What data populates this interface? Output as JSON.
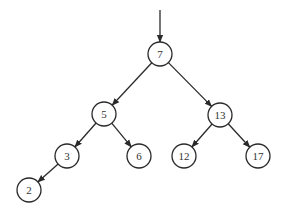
{
  "diagram": {
    "type": "binary-search-tree",
    "node_radius": 12,
    "colors": {
      "stroke": "#2a2a2a",
      "fill": "#ffffff",
      "text": "#333333",
      "background": "#ffffff"
    },
    "root_pointer": {
      "x1": 160,
      "y1": 10,
      "x2": 160,
      "y2": 42
    },
    "nodes": [
      {
        "id": "n7",
        "label": "7",
        "x": 160,
        "y": 54
      },
      {
        "id": "n5",
        "label": "5",
        "x": 104,
        "y": 114
      },
      {
        "id": "n13",
        "label": "13",
        "x": 220,
        "y": 115
      },
      {
        "id": "n3",
        "label": "3",
        "x": 67,
        "y": 156
      },
      {
        "id": "n6",
        "label": "6",
        "x": 139,
        "y": 156
      },
      {
        "id": "n12",
        "label": "12",
        "x": 184,
        "y": 156
      },
      {
        "id": "n17",
        "label": "17",
        "x": 258,
        "y": 156
      },
      {
        "id": "n2",
        "label": "2",
        "x": 29,
        "y": 190
      }
    ],
    "edges": [
      {
        "from": "n7",
        "to": "n5"
      },
      {
        "from": "n7",
        "to": "n13"
      },
      {
        "from": "n5",
        "to": "n3"
      },
      {
        "from": "n5",
        "to": "n6"
      },
      {
        "from": "n13",
        "to": "n12"
      },
      {
        "from": "n13",
        "to": "n17"
      },
      {
        "from": "n3",
        "to": "n2"
      }
    ]
  }
}
